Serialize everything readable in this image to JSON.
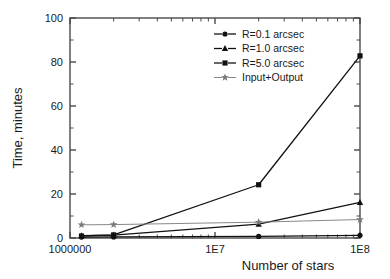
{
  "chart_data": {
    "type": "line",
    "title": "",
    "xlabel": "Number of stars",
    "ylabel": "Time, minutes",
    "xscale": "log",
    "yscale": "linear",
    "xlim": [
      1000000,
      100000000
    ],
    "ylim": [
      0,
      100
    ],
    "grid": false,
    "legend_position": "top-right",
    "xticks": [
      1000000,
      10000000,
      100000000
    ],
    "xticklabels": [
      "1000000",
      "1E7",
      "1E8"
    ],
    "yticks": [
      0,
      20,
      40,
      60,
      80,
      100
    ],
    "yticklabels": [
      "0",
      "20",
      "40",
      "60",
      "80",
      "100"
    ],
    "x": [
      1200000,
      2000000,
      20000000,
      100000000
    ],
    "series": [
      {
        "name": "R=0.1 arcsec",
        "marker": "circle",
        "color": "#111111",
        "values": [
          0.4,
          0.5,
          0.7,
          1.2
        ]
      },
      {
        "name": "R=1.0 arcsec",
        "marker": "triangle",
        "color": "#111111",
        "values": [
          1.1,
          1.3,
          6.3,
          16.2
        ]
      },
      {
        "name": "R=5.0 arcsec",
        "marker": "square",
        "color": "#111111",
        "values": [
          0.9,
          1.4,
          24.2,
          82.8
        ]
      },
      {
        "name": "Input+Output",
        "marker": "star",
        "color": "#7a7a7a",
        "values": [
          6.0,
          6.1,
          7.2,
          8.4
        ]
      }
    ]
  },
  "legend": {
    "items": [
      {
        "label": "R=0.1 arcsec",
        "marker": "circle"
      },
      {
        "label": "R=1.0 arcsec",
        "marker": "triangle"
      },
      {
        "label": "R=5.0 arcsec",
        "marker": "square"
      },
      {
        "label": "Input+Output",
        "marker": "star"
      }
    ]
  },
  "colors": {
    "axis": "#4a4a4a",
    "text": "#1a1a1a",
    "line_dark": "#111111",
    "line_light": "#7a7a7a",
    "background": "#ffffff"
  }
}
